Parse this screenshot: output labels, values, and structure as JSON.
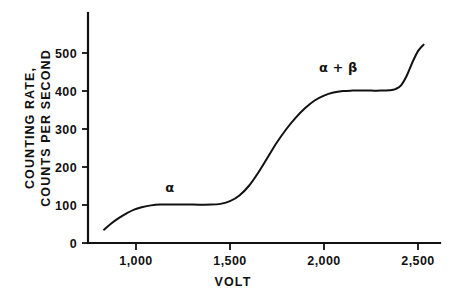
{
  "chart_data": {
    "type": "line",
    "title": "",
    "subtitle": "",
    "xlabel": "VOLT",
    "ylabel_line1": "COUNTING RATE,",
    "ylabel_line2": "COUNTS PER SECOND",
    "xlim": [
      820,
      2560
    ],
    "ylim": [
      0,
      560
    ],
    "grid": false,
    "legend": "none",
    "x_ticks": [
      {
        "value": 1000,
        "label": "1,000"
      },
      {
        "value": 1500,
        "label": "1,500"
      },
      {
        "value": 2000,
        "label": "2,000"
      },
      {
        "value": 2500,
        "label": "2,500"
      }
    ],
    "y_ticks": [
      {
        "value": 0,
        "label": "0"
      },
      {
        "value": 100,
        "label": "100"
      },
      {
        "value": 200,
        "label": "200"
      },
      {
        "value": 300,
        "label": "300"
      },
      {
        "value": 400,
        "label": "400"
      },
      {
        "value": 500,
        "label": "500"
      }
    ],
    "annotations": [
      {
        "text": "α",
        "x": 1180,
        "y": 135,
        "name": "alpha-plateau-label"
      },
      {
        "text": "α + β",
        "x": 2075,
        "y": 450,
        "name": "alpha-plus-beta-plateau-label"
      }
    ],
    "series": [
      {
        "name": "counting rate",
        "color": "#111111",
        "x": [
          830,
          870,
          910,
          950,
          990,
          1030,
          1080,
          1130,
          1200,
          1300,
          1400,
          1450,
          1500,
          1550,
          1600,
          1650,
          1700,
          1750,
          1800,
          1850,
          1900,
          1950,
          2000,
          2050,
          2100,
          2150,
          2200,
          2250,
          2300,
          2350,
          2380,
          2410,
          2440,
          2470,
          2500,
          2530
        ],
        "y": [
          35,
          52,
          66,
          78,
          88,
          94,
          99,
          101,
          101,
          101,
          101,
          103,
          110,
          125,
          150,
          185,
          225,
          265,
          300,
          330,
          355,
          375,
          388,
          396,
          400,
          401,
          401,
          401,
          401,
          402,
          405,
          415,
          440,
          475,
          505,
          522
        ]
      }
    ]
  },
  "colors": {
    "ink": "#111111",
    "background": "#ffffff"
  }
}
